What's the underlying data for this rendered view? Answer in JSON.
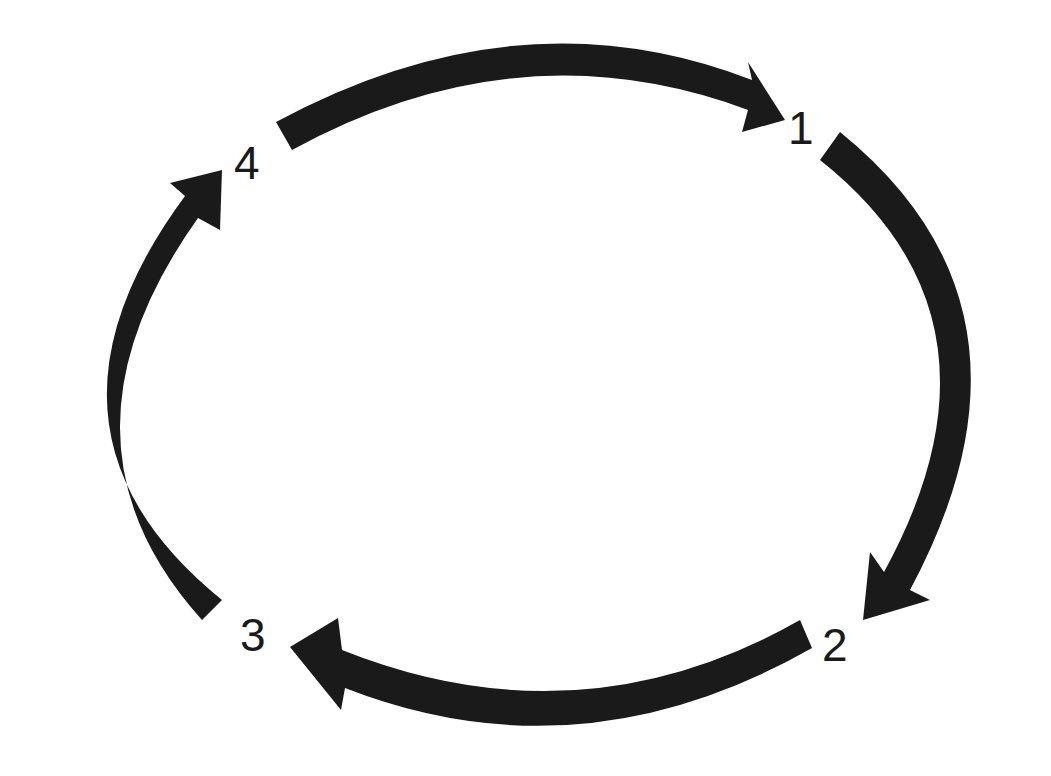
{
  "diagram": {
    "type": "cycle",
    "labels": [
      "1",
      "2",
      "3",
      "4"
    ],
    "arrow_color": "#1a1a1a",
    "background": "#ffffff",
    "arrows": [
      {
        "from": "4",
        "to": "1"
      },
      {
        "from": "1",
        "to": "2"
      },
      {
        "from": "2",
        "to": "3"
      },
      {
        "from": "3",
        "to": "4"
      }
    ]
  }
}
